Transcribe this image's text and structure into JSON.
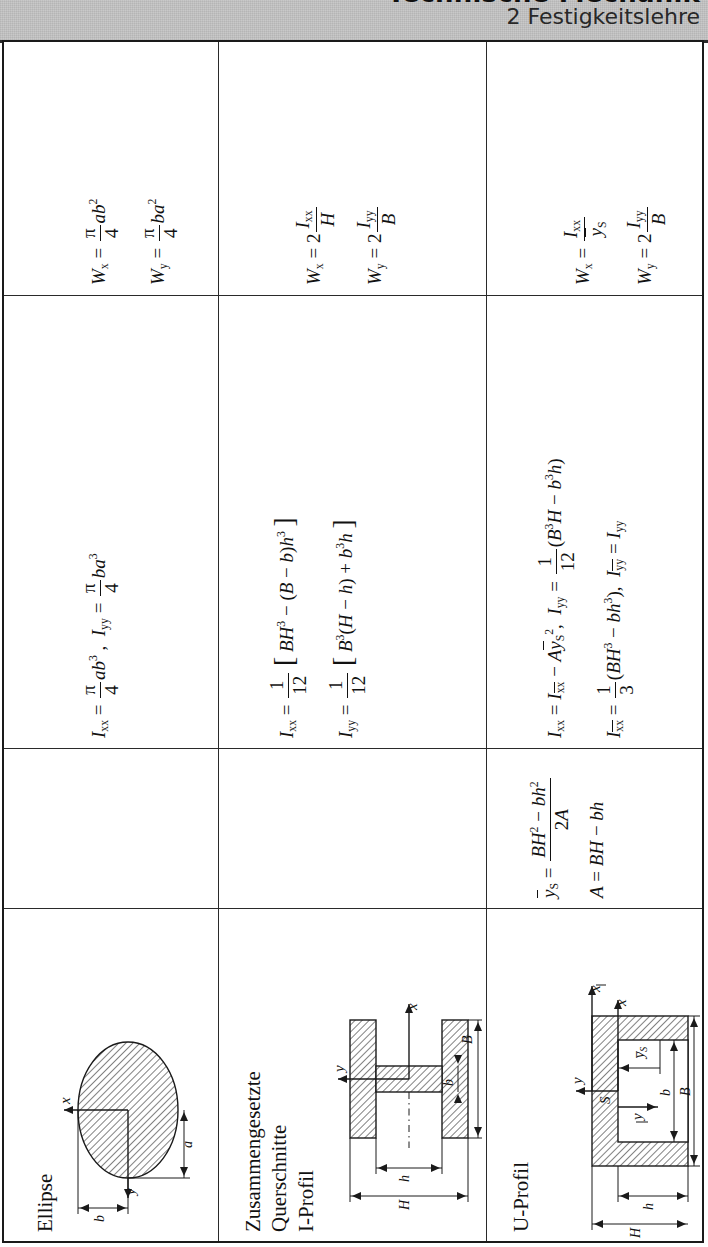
{
  "header": {
    "book_title": "Technische Mechanik",
    "chapter": "2 Festigkeitslehre"
  },
  "rows": [
    {
      "id": "ellipse",
      "name": "Ellipse",
      "section_modulus": [
        "W_x = (pi/4) a b^2",
        "W_y = (pi/4) b a^2"
      ],
      "moment_of_inertia": [
        "I_xx = (pi/4) a b^3 ,  I_yy = (pi/4) b a^3"
      ],
      "centroid": [],
      "figure_labels": [
        "x",
        "y",
        "a",
        "b"
      ]
    },
    {
      "id": "i-profil",
      "name": "Zusammengesetzte Querschnitte\nI-Profil",
      "name_lines": [
        "Zusammengesetzte",
        "Querschnitte",
        "I-Profil"
      ],
      "section_modulus": [
        "W_x = 2 I_xx / H",
        "W_y = 2 I_yy / B"
      ],
      "moment_of_inertia": [
        "I_xx = (1/12) [ B H^3 - (B - b) h^3 ]",
        "I_yy = (1/12) [ B^3 (H - h) + b^3 h ]"
      ],
      "centroid": [],
      "figure_labels": [
        "x",
        "y",
        "B",
        "b",
        "h",
        "H"
      ]
    },
    {
      "id": "u-profil",
      "name": "U-Profil",
      "section_modulus": [
        "W_x = I_xx / ybar_S",
        "W_y = 2 I_yy / B"
      ],
      "moment_of_inertia": [
        "I_xx = I_xxbar - A ybar_S^2 ,  I_yy = (1/12)(B^3 H - b^3 h) ,  I_yybar = I_yy",
        "I_xxbar = (1/3)(B H^3 - b h^3)"
      ],
      "centroid": [
        "ybar_S = (B H^2 - b h^2) / (2A)",
        "A = B H - b h"
      ],
      "figure_labels": [
        "x",
        "xbar",
        "y",
        "ybar",
        "S",
        "ybar_S",
        "B",
        "b",
        "h",
        "H"
      ]
    }
  ],
  "math": {
    "W": "W",
    "I": "I",
    "A": "A",
    "B": "B",
    "H": "H",
    "b": "b",
    "h": "h",
    "pi": "π",
    "four": "4",
    "twelve": "12",
    "three": "3",
    "two": "2",
    "one": "1",
    "2A": "2A"
  },
  "colors": {
    "header_band": "#c9c9c9",
    "rule": "#2a2a2a",
    "ink": "#111111",
    "page": "#ffffff"
  }
}
